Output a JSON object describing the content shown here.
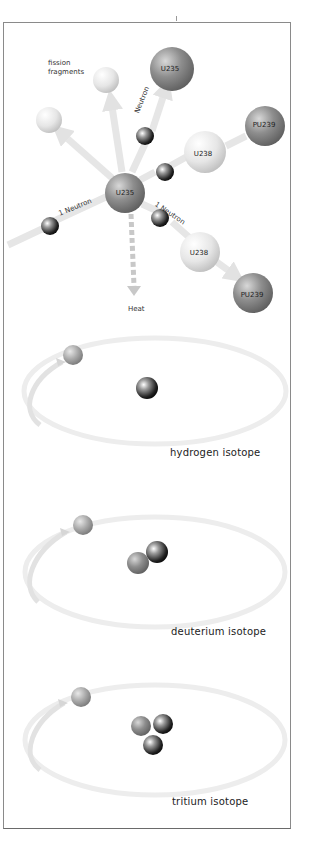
{
  "fission_diagram": {
    "labels": {
      "fission_fragments_line1": "fission",
      "fission_fragments_line2": "fragments",
      "neutron_top": "Neutron",
      "neutron_left": "1 Neutron",
      "neutron_right": "1 Neutron",
      "heat": "Heat"
    },
    "atoms": {
      "central": "U235",
      "top_target": "U235",
      "upper_u238": "U238",
      "upper_pu239": "PU239",
      "lower_u238": "U238",
      "lower_pu239": "PU239"
    }
  },
  "isotopes": [
    {
      "caption": "hydrogen isotope",
      "nucleus": [
        "neutral-dark"
      ]
    },
    {
      "caption": "deuterium isotope",
      "nucleus": [
        "gray",
        "dark"
      ]
    },
    {
      "caption": "tritium isotope",
      "nucleus": [
        "gray",
        "dark",
        "dark"
      ]
    }
  ],
  "colors": {
    "dark_sphere": "#1a1a1a",
    "gray_sphere": "#8c8c8c",
    "light_sphere": "#e6e6e6",
    "arrow": "#e4e4e4",
    "border": "#8a8a8a"
  }
}
